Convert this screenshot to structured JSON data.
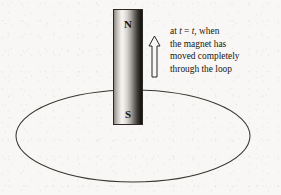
{
  "figure": {
    "background_color": "#f8f7f5",
    "width": 281,
    "height": 195
  },
  "magnet": {
    "north_label": "N",
    "south_label": "S",
    "outline_color": "#2c2823",
    "gradient_light": "#f4f3f1",
    "gradient_dark": "#141311"
  },
  "loop": {
    "name": "conducting-loop",
    "stroke_color": "#3a3530",
    "center_x": 133,
    "center_y": 136,
    "radius_x": 117,
    "radius_y": 46
  },
  "motion_arrow": {
    "direction": "up",
    "fill_color": "#f8f7f5",
    "outline_color": "#2a2722"
  },
  "caption": {
    "lines": [
      {
        "pre": "at ",
        "var1": "t",
        "mid": " = ",
        "var2": "t",
        "post": ", when"
      },
      {
        "text": "the magnet has"
      },
      {
        "text": "moved completely"
      },
      {
        "text": "through the loop"
      }
    ],
    "line1_pre": "at ",
    "line1_var1": "t",
    "line1_mid": " = ",
    "line1_var2": "t",
    "line1_post": ", when",
    "line2": "the magnet has",
    "line3": "moved completely",
    "line4": "through the loop",
    "full_text": "at t = t, when the magnet has moved completely through the loop"
  }
}
